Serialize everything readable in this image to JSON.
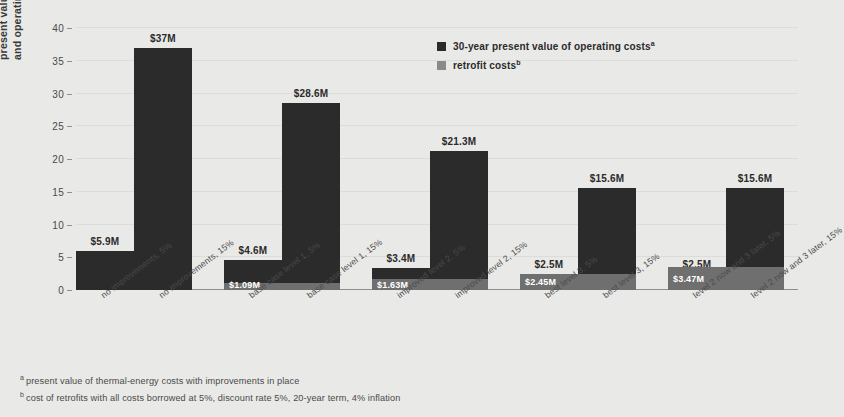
{
  "chart_data": {
    "type": "bar",
    "title": "",
    "xlabel": "",
    "ylabel": "present value of construction and operating cost (USD millions)",
    "ylim": [
      0,
      40
    ],
    "ytick_step": 5,
    "yticks": [
      "40",
      "35",
      "30",
      "25",
      "20",
      "15",
      "10",
      "5",
      "0"
    ],
    "grid": true,
    "legend_position": "upper-center-right",
    "categories": [
      "no improvements, 5%",
      "no improvements, 15%",
      "base case level 1, 5%",
      "base case level 1, 15%",
      "improved level 2, 5%",
      "improved level 2, 15%",
      "best level 3, 5%",
      "best level 3, 15%",
      "level 2 now and 3 later, 5%",
      "level 2 now and 3 later, 15%"
    ],
    "series": [
      {
        "name": "30-year present value of operating costs",
        "color": "#2b2b2b",
        "values": [
          5.9,
          37.0,
          4.6,
          28.6,
          3.4,
          21.3,
          2.5,
          15.6,
          2.5,
          15.6
        ],
        "labels": [
          "$5.9M",
          "$37M",
          "$4.6M",
          "$28.6M",
          "$3.4M",
          "$21.3M",
          "$2.5M",
          "$15.6M",
          "$2.5M",
          "$15.6M"
        ]
      },
      {
        "name": "retrofit costs",
        "color": "#6f6f6f",
        "values": [
          0,
          0,
          1.09,
          1.09,
          1.63,
          1.63,
          2.45,
          2.45,
          3.47,
          3.47
        ],
        "labels": [
          "",
          "",
          "$1.09M",
          "",
          "$1.63M",
          "",
          "$2.45M",
          "",
          "$3.47M",
          ""
        ]
      }
    ],
    "groups": [
      {
        "label_a": "no improvements, 5%",
        "label_b": "no improvements, 15%",
        "value_a": 5.9,
        "value_b": 37.0,
        "retrofit": 0.0,
        "label_a_text": "$5.9M",
        "label_b_text": "$37M",
        "retrofit_text": ""
      },
      {
        "label_a": "base case level 1, 5%",
        "label_b": "base case level 1, 15%",
        "value_a": 4.6,
        "value_b": 28.6,
        "retrofit": 1.09,
        "label_a_text": "$4.6M",
        "label_b_text": "$28.6M",
        "retrofit_text": "$1.09M"
      },
      {
        "label_a": "improved level 2, 5%",
        "label_b": "improved level 2, 15%",
        "value_a": 3.4,
        "value_b": 21.3,
        "retrofit": 1.63,
        "label_a_text": "$3.4M",
        "label_b_text": "$21.3M",
        "retrofit_text": "$1.63M"
      },
      {
        "label_a": "best level 3, 5%",
        "label_b": "best level 3, 15%",
        "value_a": 2.5,
        "value_b": 15.6,
        "retrofit": 2.45,
        "label_a_text": "$2.5M",
        "label_b_text": "$15.6M",
        "retrofit_text": "$2.45M"
      },
      {
        "label_a": "level 2 now and 3 later, 5%",
        "label_b": "level 2 now and 3 later, 15%",
        "value_a": 2.5,
        "value_b": 15.6,
        "retrofit": 3.47,
        "label_a_text": "$2.5M",
        "label_b_text": "$15.6M",
        "retrofit_text": "$3.47M"
      }
    ]
  },
  "axis": {
    "y_title_line1": "present value of construction",
    "y_title_line2": "and operating cost (USD millions)",
    "y_ticks": [
      "40",
      "35",
      "30",
      "25",
      "20",
      "15",
      "10",
      "5",
      "0"
    ]
  },
  "legend": {
    "items": [
      {
        "label": "30-year present value of operating  costs",
        "marker": "a",
        "color": "#2b2b2b"
      },
      {
        "label": "retrofit costs",
        "marker": "b",
        "color": "#8a8a8a"
      }
    ]
  },
  "footnotes": [
    {
      "marker": "a",
      "text": "present value of thermal-energy costs with improvements in place"
    },
    {
      "marker": "b",
      "text": "cost of retrofits with all costs borrowed at 5%, discount rate 5%, 20-year term, 4% inflation"
    }
  ],
  "colors": {
    "background": "#e9e9e7",
    "operating_bar": "#2b2b2b",
    "retrofit_bar": "#6f6f6f",
    "gridline": "#dcdcda",
    "axis": "#8e8e8c",
    "text": "#3a3a3a"
  }
}
